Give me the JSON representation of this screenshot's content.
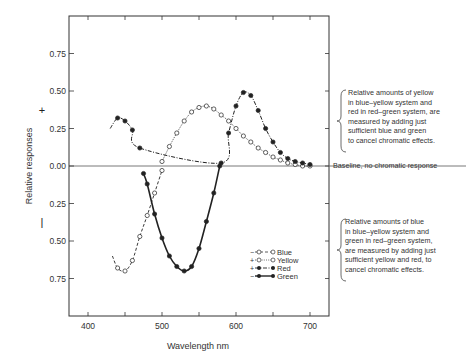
{
  "chart_data": {
    "type": "line",
    "title": "",
    "xlabel": "Wavelength nm",
    "ylabel": "Relative responses",
    "xlim": [
      375,
      725
    ],
    "ylim": [
      -1.0,
      1.0
    ],
    "x_ticks": [
      400,
      500,
      600,
      700
    ],
    "x_minor_ticks": [
      450,
      550,
      650
    ],
    "y_ticks_positive": [
      "0.00",
      "0.25",
      "0.50",
      "0.75"
    ],
    "y_ticks_negative": [
      "0.25",
      "0.50",
      "0.75"
    ],
    "y_sign_labels": {
      "positive": "+",
      "negative": "−"
    },
    "grid": false,
    "legend_position": "inside lower right of plot",
    "legend": [
      "Blue",
      "Yellow",
      "Red",
      "Green"
    ],
    "series": [
      {
        "name": "Blue",
        "marker": "open-circle",
        "line": "dashed",
        "legend_sign": "−",
        "x": [
          433,
          440,
          450,
          460,
          470,
          480,
          490,
          500
        ],
        "y": [
          -0.6,
          -0.68,
          -0.7,
          -0.63,
          -0.47,
          -0.33,
          -0.18,
          -0.03
        ]
      },
      {
        "name": "Yellow",
        "marker": "open-circle",
        "line": "dotted",
        "legend_sign": "+",
        "x": [
          500,
          510,
          520,
          530,
          540,
          550,
          560,
          570,
          580,
          590,
          600,
          610,
          620,
          630,
          640,
          650,
          660,
          670,
          680,
          690,
          700
        ],
        "y": [
          0.03,
          0.13,
          0.22,
          0.3,
          0.36,
          0.39,
          0.4,
          0.38,
          0.34,
          0.3,
          0.25,
          0.2,
          0.16,
          0.12,
          0.09,
          0.06,
          0.04,
          0.02,
          0.01,
          0.0,
          0.0
        ]
      },
      {
        "name": "Red",
        "marker": "filled-circle",
        "line": "dash-dot",
        "legend_sign": "+",
        "x": [
          430,
          440,
          450,
          460,
          470,
          580,
          590,
          600,
          610,
          620,
          630,
          640,
          650,
          660,
          670,
          680,
          690,
          700
        ],
        "y": [
          0.25,
          0.32,
          0.3,
          0.24,
          0.12,
          0.02,
          0.22,
          0.4,
          0.49,
          0.47,
          0.37,
          0.25,
          0.16,
          0.09,
          0.05,
          0.03,
          0.02,
          0.01
        ]
      },
      {
        "name": "Green",
        "marker": "filled-circle",
        "line": "solid",
        "legend_sign": "−",
        "x": [
          475,
          480,
          490,
          500,
          510,
          520,
          530,
          540,
          550,
          560,
          570,
          578
        ],
        "y": [
          -0.05,
          -0.12,
          -0.32,
          -0.48,
          -0.6,
          -0.67,
          -0.7,
          -0.67,
          -0.55,
          -0.37,
          -0.18,
          0.0
        ]
      }
    ],
    "annotations": [
      "Baseline, no chromatic response"
    ]
  },
  "annotations": {
    "positive_note": "Relative amounts of yellow\nin blue–yellow system and\nred in red–green system, are\nmeasured by adding just\nsufficient blue and green\nto cancel chromatic effects.",
    "negative_note": "Relative amounts of blue\nin blue–yellow system and\ngreen in red–green system,\nare measured by adding just\nsufficient yellow and red, to\ncancel chromatic effects.",
    "baseline_label": "Baseline, no chromatic response"
  },
  "axes": {
    "xlabel": "Wavelength nm",
    "ylabel": "Relative responses",
    "plus_sign": "+",
    "minus_sign": "−",
    "x_tick_labels": [
      "400",
      "500",
      "600",
      "700"
    ],
    "y_tick_labels_top": [
      "0.75",
      "0.50",
      "0.25",
      "0.00"
    ],
    "y_tick_labels_bottom": [
      "0.25",
      "0.50",
      "0.75"
    ]
  },
  "legend": {
    "blue": "Blue",
    "yellow": "Yellow",
    "red": "Red",
    "green": "Green",
    "blue_sign": "−",
    "yellow_sign": "+",
    "red_sign": "+",
    "green_sign": "−"
  },
  "colors": {
    "ink": "#222222",
    "frame": "#333333"
  }
}
